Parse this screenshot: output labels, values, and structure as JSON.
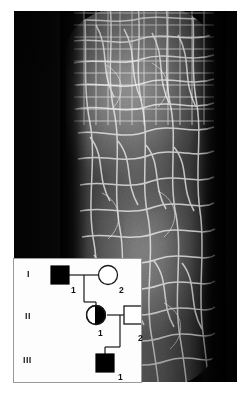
{
  "figure": {
    "type": "clinical-photograph-with-pedigree-inset",
    "photograph": {
      "subject": "skin-with-polygonal-scaling",
      "background_color": "#050505",
      "skin_tone": "#6b6b6b",
      "scale_line_color": "#e8e8e8"
    },
    "pedigree": {
      "background_color": "#fdfdfd",
      "border_color": "#9a9a9a",
      "line_color": "#1a1a1a",
      "affected_fill": "#000000",
      "unaffected_fill": "#ffffff",
      "generations": [
        {
          "roman": "I",
          "label_name": "generation-1-label",
          "individuals": [
            {
              "id": "1",
              "shape": "square",
              "status": "affected"
            },
            {
              "id": "2",
              "shape": "circle",
              "status": "unaffected"
            }
          ]
        },
        {
          "roman": "II",
          "label_name": "generation-2-label",
          "individuals": [
            {
              "id": "1",
              "shape": "circle",
              "status": "carrier"
            },
            {
              "id": "2",
              "shape": "square",
              "status": "unaffected"
            }
          ]
        },
        {
          "roman": "III",
          "label_name": "generation-3-label",
          "individuals": [
            {
              "id": "1",
              "shape": "square",
              "status": "affected"
            }
          ]
        }
      ]
    }
  }
}
